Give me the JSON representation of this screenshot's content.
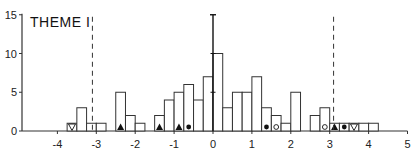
{
  "chart_data": {
    "type": "bar",
    "title": "THEME I",
    "xlabel": "",
    "ylabel": "",
    "xlim": [
      -4.8,
      5
    ],
    "ylim": [
      0,
      15
    ],
    "x_ticks": [
      -4,
      -3,
      -2,
      -1,
      0,
      1,
      2,
      3,
      4,
      5
    ],
    "y_ticks": [
      0,
      5,
      10,
      15
    ],
    "bin_width": 0.25,
    "grid": false,
    "bins": [
      {
        "x0": -3.75,
        "x1": -3.5,
        "count": 1,
        "marker": "open-triangle-down"
      },
      {
        "x0": -3.5,
        "x1": -3.25,
        "count": 3
      },
      {
        "x0": -3.25,
        "x1": -3.0,
        "count": 1
      },
      {
        "x0": -3.0,
        "x1": -2.75,
        "count": 1
      },
      {
        "x0": -2.5,
        "x1": -2.25,
        "count": 5,
        "marker": "filled-triangle"
      },
      {
        "x0": -2.25,
        "x1": -2.0,
        "count": 2
      },
      {
        "x0": -2.0,
        "x1": -1.75,
        "count": 1
      },
      {
        "x0": -1.5,
        "x1": -1.25,
        "count": 2,
        "marker": "filled-triangle"
      },
      {
        "x0": -1.25,
        "x1": -1.0,
        "count": 4
      },
      {
        "x0": -1.0,
        "x1": -0.75,
        "count": 5,
        "marker": "filled-triangle"
      },
      {
        "x0": -0.75,
        "x1": -0.5,
        "count": 6,
        "marker": "filled-circle"
      },
      {
        "x0": -0.5,
        "x1": -0.25,
        "count": 4
      },
      {
        "x0": -0.25,
        "x1": 0.0,
        "count": 7
      },
      {
        "x0": 0.0,
        "x1": 0.25,
        "count": 10
      },
      {
        "x0": 0.25,
        "x1": 0.5,
        "count": 3
      },
      {
        "x0": 0.5,
        "x1": 0.75,
        "count": 5
      },
      {
        "x0": 0.75,
        "x1": 1.0,
        "count": 5
      },
      {
        "x0": 1.0,
        "x1": 1.25,
        "count": 7
      },
      {
        "x0": 1.25,
        "x1": 1.5,
        "count": 3,
        "marker": "filled-circle"
      },
      {
        "x0": 1.5,
        "x1": 1.75,
        "count": 2,
        "marker": "open-circle"
      },
      {
        "x0": 1.75,
        "x1": 2.0,
        "count": 1
      },
      {
        "x0": 2.0,
        "x1": 2.25,
        "count": 5
      },
      {
        "x0": 2.5,
        "x1": 2.75,
        "count": 2
      },
      {
        "x0": 2.75,
        "x1": 3.0,
        "count": 3,
        "marker": "open-circle"
      },
      {
        "x0": 3.0,
        "x1": 3.25,
        "count": 1,
        "marker": "filled-triangle"
      },
      {
        "x0": 3.25,
        "x1": 3.5,
        "count": 1,
        "marker": "filled-circle"
      },
      {
        "x0": 3.5,
        "x1": 3.75,
        "count": 1,
        "marker": "open-triangle-down"
      },
      {
        "x0": 3.75,
        "x1": 4.0,
        "count": 1
      },
      {
        "x0": 4.0,
        "x1": 4.25,
        "count": 1
      }
    ],
    "reference_lines": [
      {
        "x": -3.1,
        "style": "dashed"
      },
      {
        "x": 3.1,
        "style": "dashed"
      },
      {
        "x": 0,
        "style": "solid",
        "note": "central axis with error cap at 15"
      }
    ]
  }
}
